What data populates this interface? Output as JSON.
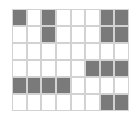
{
  "grid": {
    "rows": 6,
    "cols": 8,
    "filled_color": "#7a7a7a",
    "empty_color": "#ffffff",
    "line_color": "#d2d2d2",
    "cells": [
      [
        1,
        0,
        1,
        0,
        0,
        0,
        1,
        1
      ],
      [
        0,
        0,
        1,
        0,
        0,
        0,
        1,
        1
      ],
      [
        0,
        0,
        0,
        0,
        0,
        0,
        0,
        0
      ],
      [
        0,
        0,
        0,
        0,
        0,
        1,
        1,
        1
      ],
      [
        1,
        1,
        1,
        1,
        0,
        0,
        0,
        0
      ],
      [
        0,
        0,
        0,
        0,
        0,
        0,
        1,
        1
      ]
    ]
  }
}
